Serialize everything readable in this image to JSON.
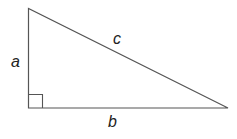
{
  "diagram": {
    "labels": {
      "side_a": "a",
      "side_b": "b",
      "side_c": "c"
    },
    "colors": {
      "stroke": "#555555",
      "text": "#222222",
      "background": "#ffffff"
    }
  }
}
